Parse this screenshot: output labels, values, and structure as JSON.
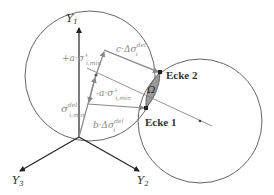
{
  "diagram": {
    "axes": {
      "y1": "Y",
      "y1_sub": "1",
      "y2": "Y",
      "y2_sub": "2",
      "y3": "Y",
      "y3_sub": "3"
    },
    "labels": {
      "plus_alpha_sigma": "+a·σ",
      "plus_alpha_sigma_sup": "+",
      "plus_alpha_sigma_sub": "i,min",
      "c_delta_sigma": "c·Δσ",
      "c_delta_sigma_sup": "del",
      "c_delta_sigma_sub": "i",
      "minus_alpha_sigma": "-a·σ",
      "minus_alpha_sigma_sup": "+",
      "minus_alpha_sigma_sub": "i,min",
      "sigma_del_min": "σ",
      "sigma_del_min_sup": "del",
      "sigma_del_min_sub": "i,min",
      "b_delta_sigma": "b·Δσ",
      "b_delta_sigma_sup": "del",
      "b_delta_sigma_sub": "i",
      "omega": "Ω",
      "ecke2": "Ecke 2",
      "ecke1": "Ecke 1"
    },
    "colors": {
      "axis": "#222222",
      "circle": "#666666",
      "vector": "#888888",
      "label_gray": "#8a8a8a",
      "omega_fill": "#9a9a9a",
      "text_dark": "#333333"
    }
  }
}
